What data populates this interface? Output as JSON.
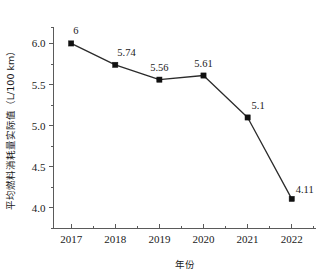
{
  "chart_data": {
    "type": "line",
    "title": "",
    "xlabel": "年份",
    "ylabel": "平均燃料消耗量实际值（L/100 km）",
    "categories": [
      "2017",
      "2018",
      "2019",
      "2020",
      "2021",
      "2022"
    ],
    "values": [
      6,
      5.74,
      5.56,
      5.61,
      5.1,
      4.11
    ],
    "point_labels": [
      "6",
      "5.74",
      "5.56",
      "5.61",
      "5.1",
      "4.11"
    ],
    "series": [
      {
        "name": "平均燃料消耗量实际值",
        "values": [
          6,
          5.74,
          5.56,
          5.61,
          5.1,
          4.11
        ]
      }
    ],
    "ylim": [
      3.75,
      6.2
    ],
    "xlim": [
      2016.6,
      2022.55
    ],
    "y_ticks": [
      "4.0",
      "4.5",
      "5.0",
      "5.5",
      "6.0"
    ],
    "y_tick_values": [
      4.0,
      4.5,
      5.0,
      5.5,
      6.0
    ],
    "y_minor_tick_values": [
      3.75,
      4.25,
      4.75,
      5.25,
      5.75,
      6.2
    ],
    "x_ticks": [
      "2017",
      "2018",
      "2019",
      "2020",
      "2021",
      "2022"
    ],
    "grid": false,
    "legend": false,
    "marker": "square",
    "marker_color": "#111111",
    "line_color": "#2b2b2b",
    "background": "#ffffff"
  }
}
